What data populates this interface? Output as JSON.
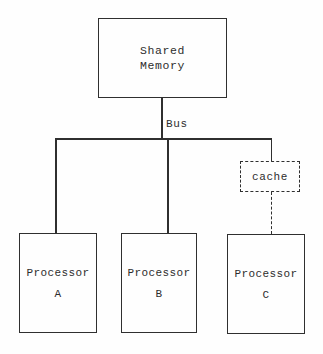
{
  "memory_box": {
    "line1": "Shared",
    "line2": "Memory"
  },
  "bus": {
    "label": "Bus"
  },
  "cache_box": {
    "label": "cache"
  },
  "processors": [
    {
      "name": "Processor",
      "id": "A"
    },
    {
      "name": "Processor",
      "id": "B"
    },
    {
      "name": "Processor",
      "id": "C"
    }
  ],
  "colors": {
    "ink": "#2f2f2f",
    "background": "#fefefe"
  }
}
